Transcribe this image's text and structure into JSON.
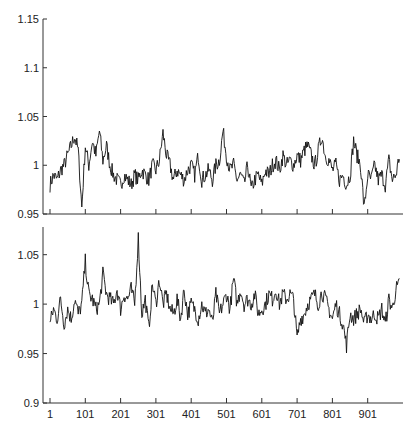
{
  "chart_data": [
    {
      "type": "line",
      "title": "",
      "xlabel": "",
      "ylabel": "",
      "xlim": [
        1,
        1000
      ],
      "ylim": [
        0.95,
        1.15
      ],
      "yticks": [
        0.95,
        1,
        1.05,
        1.1,
        1.15
      ],
      "ytick_labels": [
        "0.95",
        "1",
        "1.05",
        "1.1",
        "1.15"
      ],
      "xticks": [
        1,
        101,
        201,
        301,
        401,
        501,
        601,
        701,
        801,
        901
      ],
      "xtick_labels": [],
      "grid": false,
      "legend": null,
      "x_step": 10,
      "x_start": 1,
      "series": [
        {
          "name": "top",
          "color": "#111111",
          "values": [
            0.98,
            0.99,
            0.985,
            0.995,
            1.0,
            1.01,
            1.02,
            1.03,
            1.015,
            0.957,
            1.02,
            1.0,
            1.025,
            1.01,
            1.035,
            1.005,
            1.02,
            1.0,
            0.99,
            0.985,
            0.98,
            0.99,
            0.985,
            0.98,
            0.99,
            0.985,
            0.995,
            0.99,
            0.985,
            1.0,
            0.995,
            1.005,
            1.033,
            1.01,
            1.0,
            0.985,
            0.995,
            0.99,
            0.985,
            0.995,
            1.0,
            0.99,
            1.01,
            0.985,
            0.99,
            0.995,
            0.985,
            1.0,
            1.005,
            1.035,
            1.01,
            0.995,
            1.0,
            0.985,
            0.99,
            0.98,
            1.0,
            0.975,
            0.985,
            0.99,
            0.98,
            0.995,
            0.99,
            1.0,
            1.005,
            0.995,
            1.01,
            1.0,
            1.005,
            1.0,
            1.01,
            1.005,
            1.015,
            1.02,
            1.01,
            1.0,
            1.015,
            1.03,
            1.01,
            1.005,
            0.995,
            1.0,
            0.985,
            0.99,
            0.98,
            0.99,
            1.025,
            1.01,
            1.0,
            0.955,
            0.99,
            0.985,
            1.0,
            0.985,
            0.99,
            0.98,
            1.005,
            0.985,
            0.99,
            1.01
          ]
        }
      ]
    },
    {
      "type": "line",
      "title": "",
      "xlabel": "",
      "ylabel": "",
      "xlim": [
        1,
        1000
      ],
      "ylim": [
        0.9,
        1.078
      ],
      "yticks": [
        0.9,
        0.95,
        1,
        1.05
      ],
      "ytick_labels": [
        "0.9",
        "0.95",
        "1",
        "1.05"
      ],
      "xticks": [
        1,
        101,
        201,
        301,
        401,
        501,
        601,
        701,
        801,
        901
      ],
      "xtick_labels": [
        "1",
        "101",
        "201",
        "301",
        "401",
        "501",
        "601",
        "701",
        "801",
        "901"
      ],
      "grid": false,
      "legend": null,
      "x_step": 10,
      "x_start": 1,
      "series": [
        {
          "name": "bottom",
          "color": "#111111",
          "values": [
            0.98,
            0.995,
            0.985,
            1.005,
            0.98,
            0.995,
            0.985,
            1.005,
            0.99,
            1.0,
            1.043,
            1.01,
            1.005,
            0.995,
            1.0,
            1.03,
            1.01,
            1.005,
            1.0,
            1.015,
            0.995,
            1.01,
            1.005,
            1.015,
            1.0,
            1.067,
            0.99,
            1.005,
            0.975,
            1.02,
            1.0,
            1.025,
            1.0,
            1.01,
            0.995,
            0.99,
            1.005,
            0.985,
            1.015,
            0.99,
            1.0,
            0.995,
            0.985,
            1.0,
            0.99,
            0.995,
            0.98,
            1.01,
            0.99,
            1.0,
            1.01,
            0.995,
            1.025,
            1.0,
            1.015,
            1.0,
            1.005,
            1.0,
            1.01,
            0.99,
            0.995,
            1.0,
            1.01,
            1.005,
            1.015,
            1.0,
            1.01,
            1.005,
            1.01,
            1.005,
            0.965,
            0.985,
            0.99,
            1.0,
            1.005,
            1.01,
            1.0,
            1.012,
            1.005,
            0.995,
            0.985,
            1.0,
            0.99,
            0.98,
            0.958,
            0.99,
            0.985,
            0.99,
            0.995,
            0.98,
            0.99,
            0.985,
            0.99,
            0.985,
            0.995,
            0.98,
            1.005,
            0.995,
            1.015,
            1.02
          ]
        }
      ]
    }
  ]
}
